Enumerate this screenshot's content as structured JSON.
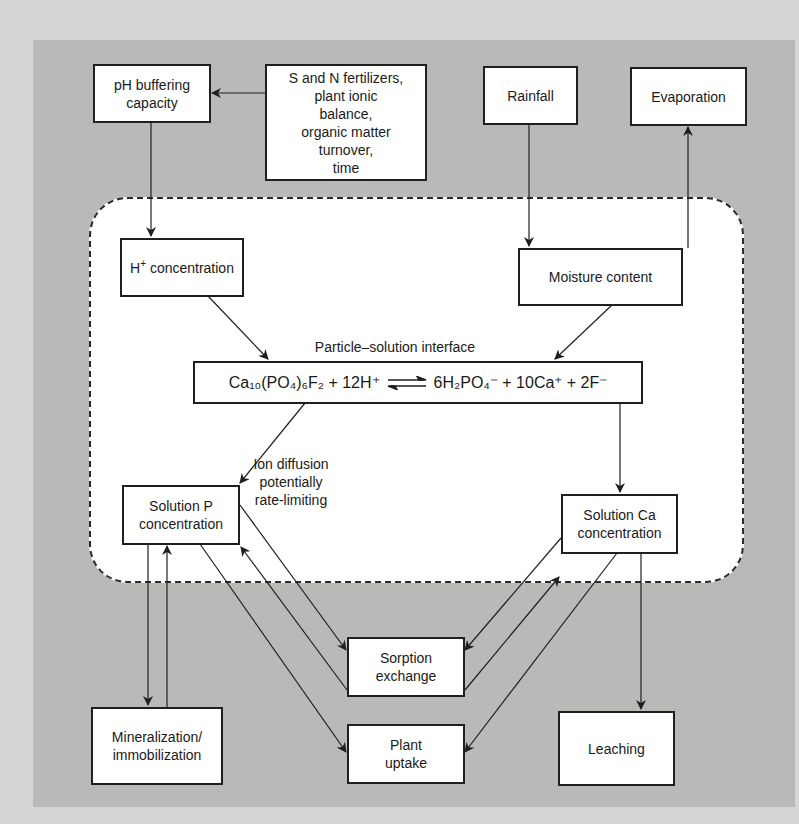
{
  "diagram": {
    "outside_nodes": {
      "ph_buffering": "pH buffering capacity",
      "drivers": [
        "S and N fertilizers,",
        "plant ionic",
        "balance,",
        "organic matter",
        "turnover,",
        "time"
      ],
      "rainfall": "Rainfall",
      "evaporation": "Evaporation"
    },
    "zone_nodes": {
      "h_conc_label": "concentration",
      "h_symbol": "H",
      "h_charge": "+",
      "moisture": "Moisture content",
      "interface_label": "Particle–solution interface",
      "equation": {
        "left": "Ca₁₀(PO₄)₆F₂ + 12H⁺",
        "right": "6H₂PO₄⁻ + 10Ca⁺ + 2F⁻",
        "arrow": "reversible"
      },
      "ion_diffusion": [
        "Ion diffusion",
        "potentially",
        "rate-limiting"
      ],
      "solution_p": [
        "Solution P",
        "concentration"
      ],
      "solution_ca": [
        "Solution Ca",
        "concentration"
      ]
    },
    "bottom_nodes": {
      "mineralization": [
        "Mineralization/",
        "immobilization"
      ],
      "sorption": [
        "Sorption",
        "exchange"
      ],
      "plant_uptake": [
        "Plant",
        "uptake"
      ],
      "leaching": "Leaching"
    },
    "edges": [
      {
        "from": "S and N fertilizers...",
        "to": "pH buffering capacity"
      },
      {
        "from": "pH buffering capacity",
        "to": "H+ concentration"
      },
      {
        "from": "Rainfall",
        "to": "Moisture content"
      },
      {
        "from": "Moisture content",
        "to": "Evaporation"
      },
      {
        "from": "H+ concentration",
        "to": "Particle–solution interface"
      },
      {
        "from": "Moisture content",
        "to": "Particle–solution interface"
      },
      {
        "from": "Particle–solution interface",
        "to": "Solution P concentration"
      },
      {
        "from": "Particle–solution interface",
        "to": "Solution Ca concentration"
      },
      {
        "from": "Solution P concentration",
        "to": "Mineralization/immobilization"
      },
      {
        "from": "Mineralization/immobilization",
        "to": "Solution P concentration"
      },
      {
        "from": "Solution P concentration",
        "to": "Sorption exchange"
      },
      {
        "from": "Sorption exchange",
        "to": "Solution P concentration"
      },
      {
        "from": "Solution P concentration",
        "to": "Plant uptake"
      },
      {
        "from": "Solution Ca concentration",
        "to": "Sorption exchange"
      },
      {
        "from": "Sorption exchange",
        "to": "Solution Ca concentration"
      },
      {
        "from": "Solution Ca concentration",
        "to": "Plant uptake"
      },
      {
        "from": "Solution Ca concentration",
        "to": "Leaching"
      }
    ],
    "colors": {
      "page_bg": "#d6d6d4",
      "panel_bg": "#b9b9b7",
      "box_bg": "#ffffff",
      "line": "#1f1f1f"
    }
  }
}
